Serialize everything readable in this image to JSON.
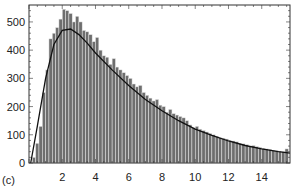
{
  "panel_label": "(c)",
  "colors": {
    "bar_fill": "#6e6e6e",
    "bar_edge": "#e8e8e8",
    "curve": "#111111",
    "frame": "#333333"
  },
  "chart_data": {
    "type": "bar",
    "title": "",
    "xlabel": "",
    "ylabel": "",
    "xlim": [
      0,
      15.7
    ],
    "ylim": [
      0,
      560
    ],
    "grid": false,
    "legend": null,
    "xticks": [
      2,
      4,
      6,
      8,
      10,
      12,
      14
    ],
    "yticks": [
      0,
      100,
      200,
      300,
      400,
      500
    ],
    "bin_width": 0.2,
    "bin_starts": [
      0.2,
      0.4,
      0.6,
      0.8,
      1.0,
      1.2,
      1.4,
      1.6,
      1.8,
      2.0,
      2.2,
      2.4,
      2.6,
      2.8,
      3.0,
      3.2,
      3.4,
      3.6,
      3.8,
      4.0,
      4.2,
      4.4,
      4.6,
      4.8,
      5.0,
      5.2,
      5.4,
      5.6,
      5.8,
      6.0,
      6.2,
      6.4,
      6.6,
      6.8,
      7.0,
      7.2,
      7.4,
      7.6,
      7.8,
      8.0,
      8.2,
      8.4,
      8.6,
      8.8,
      9.0,
      9.2,
      9.4,
      9.6,
      9.8,
      10.0,
      10.2,
      10.4,
      10.6,
      10.8,
      11.0,
      11.2,
      11.4,
      11.6,
      11.8,
      12.0,
      12.2,
      12.4,
      12.6,
      12.8,
      13.0,
      13.2,
      13.4,
      13.6,
      13.8,
      14.0,
      14.2,
      14.4,
      14.6,
      14.8,
      15.0,
      15.2,
      15.4
    ],
    "values": [
      20,
      70,
      130,
      250,
      330,
      440,
      460,
      480,
      510,
      545,
      540,
      530,
      500,
      520,
      500,
      470,
      465,
      455,
      430,
      445,
      400,
      380,
      375,
      350,
      370,
      340,
      330,
      320,
      310,
      300,
      280,
      270,
      275,
      250,
      240,
      230,
      220,
      225,
      205,
      200,
      180,
      190,
      175,
      170,
      165,
      160,
      150,
      135,
      125,
      130,
      120,
      115,
      110,
      105,
      100,
      95,
      90,
      88,
      85,
      80,
      78,
      75,
      70,
      68,
      65,
      60,
      62,
      58,
      55,
      52,
      50,
      48,
      45,
      43,
      42,
      40,
      50
    ],
    "series": [
      {
        "name": "histogram",
        "kind": "bar"
      },
      {
        "name": "fit curve",
        "kind": "line",
        "x": [
          0.1,
          0.5,
          1.0,
          1.5,
          2.0,
          2.5,
          3.0,
          3.5,
          4.0,
          5.0,
          6.0,
          7.0,
          8.0,
          9.0,
          10.0,
          11.0,
          12.0,
          13.0,
          14.0,
          15.0,
          15.7
        ],
        "y": [
          0,
          130,
          300,
          420,
          470,
          475,
          455,
          425,
          390,
          330,
          275,
          225,
          185,
          150,
          120,
          98,
          78,
          62,
          50,
          40,
          35
        ]
      }
    ]
  }
}
